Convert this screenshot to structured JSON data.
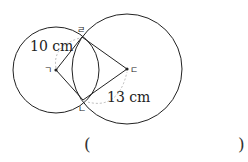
{
  "diagram": {
    "colors": {
      "stroke": "#222222",
      "dashed": "#aaaaaa",
      "point": "#222222"
    },
    "circles": [
      {
        "name": "left-circle",
        "center_label": "ㄱ",
        "cx": 56,
        "cy": 70,
        "r": 43
      },
      {
        "name": "right-circle",
        "center_label": "ㄷ",
        "cx": 127,
        "cy": 69,
        "r": 55
      }
    ],
    "points": {
      "g": {
        "label": "ㄱ",
        "x": 56,
        "y": 70
      },
      "d": {
        "label": "ㄷ",
        "x": 127,
        "y": 69
      },
      "r": {
        "label": "ㄹ",
        "x": 82,
        "y": 37
      },
      "n": {
        "label": "ㄴ",
        "x": 83,
        "y": 100
      }
    },
    "lengths": {
      "left_radius": "10 cm",
      "right_radius": "13 cm"
    }
  },
  "answer": {
    "open_paren": "(",
    "close_paren": ")"
  }
}
